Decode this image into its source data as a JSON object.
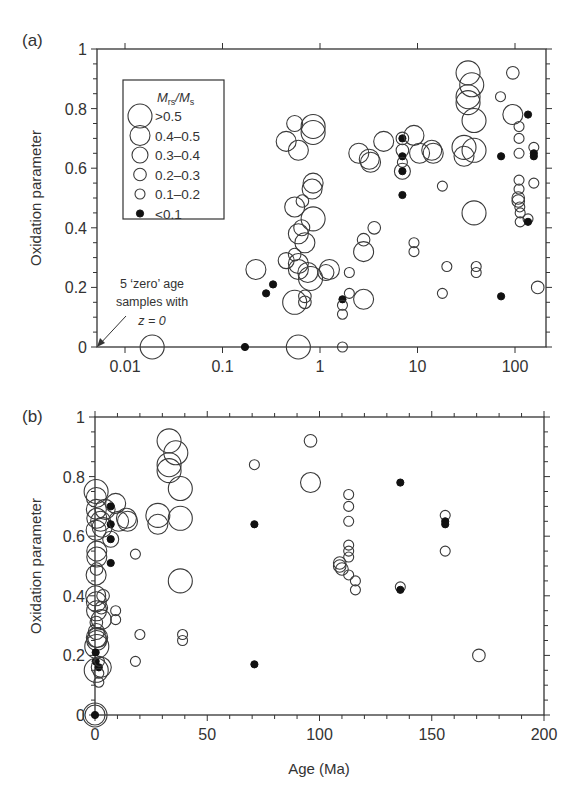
{
  "chart_data": [
    {
      "panel": "(a)",
      "type": "scatter",
      "xlabel": "",
      "ylabel": "Oxidation parameter",
      "xscale": "log",
      "xlim": [
        0.005,
        200
      ],
      "ylim": [
        0,
        1
      ],
      "xticks": [
        0.01,
        0.1,
        1,
        10,
        100
      ],
      "xtick_labels": [
        "0.01",
        "0.1",
        "1",
        "10",
        "100"
      ],
      "yticks": [
        0,
        0.2,
        0.4,
        0.6,
        0.8,
        1
      ],
      "ytick_labels": [
        "0",
        "0.2",
        "0.4",
        "0.6",
        "0.8",
        "1"
      ],
      "legend": {
        "title_main": "M",
        "title_sub1": "rs",
        "title_sep": "/M",
        "title_sub2": "s",
        "entries": [
          {
            "key": "s5",
            "label": ">0.5"
          },
          {
            "key": "s4",
            "label": "0.4–0.5"
          },
          {
            "key": "s3",
            "label": "0.3–0.4"
          },
          {
            "key": "s2",
            "label": "0.2–0.3"
          },
          {
            "key": "s1",
            "label": "0.1–0.2"
          },
          {
            "key": "f",
            "label": "<0.1"
          }
        ]
      },
      "annotation": {
        "line1": "5 ‘zero’ age",
        "line2": "samples with",
        "line3": "z = 0"
      },
      "points": [
        {
          "x": 0.019,
          "y": 0.0,
          "c": "s5"
        },
        {
          "x": 0.17,
          "y": 0.0,
          "c": "f"
        },
        {
          "x": 0.22,
          "y": 0.26,
          "c": "s4"
        },
        {
          "x": 0.28,
          "y": 0.18,
          "c": "f"
        },
        {
          "x": 0.33,
          "y": 0.21,
          "c": "f"
        },
        {
          "x": 0.45,
          "y": 0.69,
          "c": "s4"
        },
        {
          "x": 0.55,
          "y": 0.75,
          "c": "s3"
        },
        {
          "x": 0.6,
          "y": 0.66,
          "c": "s4"
        },
        {
          "x": 0.55,
          "y": 0.47,
          "c": "s4"
        },
        {
          "x": 0.66,
          "y": 0.49,
          "c": "s2"
        },
        {
          "x": 0.85,
          "y": 0.72,
          "c": "s5"
        },
        {
          "x": 0.85,
          "y": 0.74,
          "c": "s5"
        },
        {
          "x": 0.85,
          "y": 0.55,
          "c": "s4"
        },
        {
          "x": 0.83,
          "y": 0.53,
          "c": "s4"
        },
        {
          "x": 0.45,
          "y": 0.29,
          "c": "s3"
        },
        {
          "x": 0.55,
          "y": 0.31,
          "c": "s2"
        },
        {
          "x": 0.7,
          "y": 0.35,
          "c": "s4"
        },
        {
          "x": 0.6,
          "y": 0.38,
          "c": "s4"
        },
        {
          "x": 0.65,
          "y": 0.4,
          "c": "s3"
        },
        {
          "x": 0.85,
          "y": 0.43,
          "c": "s5"
        },
        {
          "x": 0.6,
          "y": 0.26,
          "c": "s4"
        },
        {
          "x": 0.6,
          "y": 0.28,
          "c": "s4"
        },
        {
          "x": 0.75,
          "y": 0.25,
          "c": "s4"
        },
        {
          "x": 0.8,
          "y": 0.23,
          "c": "s5"
        },
        {
          "x": 1.25,
          "y": 0.26,
          "c": "s4"
        },
        {
          "x": 1.15,
          "y": 0.25,
          "c": "s3"
        },
        {
          "x": 0.7,
          "y": 0.17,
          "c": "s2"
        },
        {
          "x": 0.7,
          "y": 0.15,
          "c": "s2"
        },
        {
          "x": 0.55,
          "y": 0.15,
          "c": "s5"
        },
        {
          "x": 0.6,
          "y": 0.0,
          "c": "s5"
        },
        {
          "x": 1.7,
          "y": 0.16,
          "c": "f"
        },
        {
          "x": 1.7,
          "y": 0.14,
          "c": "s1"
        },
        {
          "x": 1.7,
          "y": 0.11,
          "c": "s1"
        },
        {
          "x": 1.7,
          "y": 0.0,
          "c": "s1"
        },
        {
          "x": 2.0,
          "y": 0.25,
          "c": "s1"
        },
        {
          "x": 2.0,
          "y": 0.18,
          "c": "s1"
        },
        {
          "x": 2.8,
          "y": 0.16,
          "c": "s4"
        },
        {
          "x": 2.8,
          "y": 0.32,
          "c": "s4"
        },
        {
          "x": 2.8,
          "y": 0.36,
          "c": "s2"
        },
        {
          "x": 3.6,
          "y": 0.4,
          "c": "s2"
        },
        {
          "x": 2.5,
          "y": 0.65,
          "c": "s4"
        },
        {
          "x": 3.2,
          "y": 0.63,
          "c": "s4"
        },
        {
          "x": 3.3,
          "y": 0.62,
          "c": "s4"
        },
        {
          "x": 4.5,
          "y": 0.69,
          "c": "s4"
        },
        {
          "x": 7.0,
          "y": 0.7,
          "c": "f"
        },
        {
          "x": 7.0,
          "y": 0.7,
          "c": "s2"
        },
        {
          "x": 7.0,
          "y": 0.66,
          "c": "s2"
        },
        {
          "x": 7.0,
          "y": 0.64,
          "c": "f"
        },
        {
          "x": 7.0,
          "y": 0.62,
          "c": "s1"
        },
        {
          "x": 7.0,
          "y": 0.59,
          "c": "f"
        },
        {
          "x": 7.0,
          "y": 0.59,
          "c": "s3"
        },
        {
          "x": 7.0,
          "y": 0.51,
          "c": "f"
        },
        {
          "x": 9.2,
          "y": 0.71,
          "c": "s4"
        },
        {
          "x": 10.5,
          "y": 0.65,
          "c": "s4"
        },
        {
          "x": 14,
          "y": 0.66,
          "c": "s4"
        },
        {
          "x": 14.5,
          "y": 0.65,
          "c": "s4"
        },
        {
          "x": 18,
          "y": 0.54,
          "c": "s1"
        },
        {
          "x": 9.2,
          "y": 0.35,
          "c": "s1"
        },
        {
          "x": 9.2,
          "y": 0.32,
          "c": "s1"
        },
        {
          "x": 20,
          "y": 0.27,
          "c": "s1"
        },
        {
          "x": 18,
          "y": 0.18,
          "c": "s1"
        },
        {
          "x": 33,
          "y": 0.92,
          "c": "s5"
        },
        {
          "x": 36,
          "y": 0.88,
          "c": "s5"
        },
        {
          "x": 33,
          "y": 0.84,
          "c": "s5"
        },
        {
          "x": 33,
          "y": 0.82,
          "c": "s5"
        },
        {
          "x": 38,
          "y": 0.76,
          "c": "s5"
        },
        {
          "x": 30,
          "y": 0.67,
          "c": "s5"
        },
        {
          "x": 30,
          "y": 0.64,
          "c": "s4"
        },
        {
          "x": 38,
          "y": 0.66,
          "c": "s5"
        },
        {
          "x": 38,
          "y": 0.45,
          "c": "s5"
        },
        {
          "x": 40,
          "y": 0.27,
          "c": "s1"
        },
        {
          "x": 40,
          "y": 0.25,
          "c": "s1"
        },
        {
          "x": 72,
          "y": 0.17,
          "c": "f"
        },
        {
          "x": 72,
          "y": 0.64,
          "c": "f"
        },
        {
          "x": 71,
          "y": 0.84,
          "c": "s1"
        },
        {
          "x": 95,
          "y": 0.92,
          "c": "s2"
        },
        {
          "x": 95,
          "y": 0.78,
          "c": "s4"
        },
        {
          "x": 110,
          "y": 0.74,
          "c": "s1"
        },
        {
          "x": 110,
          "y": 0.7,
          "c": "s1"
        },
        {
          "x": 110,
          "y": 0.65,
          "c": "s1"
        },
        {
          "x": 110,
          "y": 0.56,
          "c": "s1"
        },
        {
          "x": 110,
          "y": 0.53,
          "c": "s1"
        },
        {
          "x": 108,
          "y": 0.5,
          "c": "s2"
        },
        {
          "x": 108,
          "y": 0.49,
          "c": "s2"
        },
        {
          "x": 112,
          "y": 0.47,
          "c": "s1"
        },
        {
          "x": 113,
          "y": 0.45,
          "c": "s1"
        },
        {
          "x": 113,
          "y": 0.42,
          "c": "s1"
        },
        {
          "x": 136,
          "y": 0.78,
          "c": "f"
        },
        {
          "x": 136,
          "y": 0.43,
          "c": "s1"
        },
        {
          "x": 136,
          "y": 0.42,
          "c": "f"
        },
        {
          "x": 156,
          "y": 0.67,
          "c": "s1"
        },
        {
          "x": 156,
          "y": 0.65,
          "c": "f"
        },
        {
          "x": 156,
          "y": 0.64,
          "c": "f"
        },
        {
          "x": 156,
          "y": 0.55,
          "c": "s1"
        },
        {
          "x": 171,
          "y": 0.2,
          "c": "s2"
        }
      ]
    },
    {
      "panel": "(b)",
      "type": "scatter",
      "xlabel": "Age (Ma)",
      "ylabel": "Oxidation parameter",
      "xscale": "linear",
      "xlim": [
        0,
        200
      ],
      "ylim": [
        0,
        1
      ],
      "xticks": [
        0,
        50,
        100,
        150,
        200
      ],
      "xtick_labels": [
        "0",
        "50",
        "100",
        "150",
        "200"
      ],
      "yticks": [
        0,
        0.2,
        0.4,
        0.6,
        0.8,
        1
      ],
      "ytick_labels": [
        "0",
        "0.2",
        "0.4",
        "0.6",
        "0.8",
        "1"
      ],
      "points": [
        {
          "x": 0,
          "y": 0.0,
          "c": "s5"
        },
        {
          "x": 0,
          "y": 0.0,
          "c": "s4"
        },
        {
          "x": 0,
          "y": 0.0,
          "c": "f"
        },
        {
          "x": 0.5,
          "y": 0.75,
          "c": "s5"
        },
        {
          "x": 0.6,
          "y": 0.73,
          "c": "s4"
        },
        {
          "x": 0.6,
          "y": 0.69,
          "c": "s4"
        },
        {
          "x": 0.8,
          "y": 0.66,
          "c": "s4"
        },
        {
          "x": 0.5,
          "y": 0.62,
          "c": "s4"
        },
        {
          "x": 0.8,
          "y": 0.55,
          "c": "s4"
        },
        {
          "x": 0.8,
          "y": 0.53,
          "c": "s4"
        },
        {
          "x": 0.5,
          "y": 0.47,
          "c": "s4"
        },
        {
          "x": 0.7,
          "y": 0.49,
          "c": "s2"
        },
        {
          "x": 0.3,
          "y": 0.4,
          "c": "s4"
        },
        {
          "x": 0.6,
          "y": 0.38,
          "c": "s4"
        },
        {
          "x": 0.7,
          "y": 0.35,
          "c": "s4"
        },
        {
          "x": 0.6,
          "y": 0.31,
          "c": "s2"
        },
        {
          "x": 0.6,
          "y": 0.28,
          "c": "s3"
        },
        {
          "x": 0.6,
          "y": 0.26,
          "c": "s4"
        },
        {
          "x": 0.75,
          "y": 0.25,
          "c": "s4"
        },
        {
          "x": 0.8,
          "y": 0.23,
          "c": "s5"
        },
        {
          "x": 1.2,
          "y": 0.26,
          "c": "s4"
        },
        {
          "x": 0.3,
          "y": 0.21,
          "c": "f"
        },
        {
          "x": 0.3,
          "y": 0.18,
          "c": "f"
        },
        {
          "x": 0.55,
          "y": 0.15,
          "c": "s5"
        },
        {
          "x": 1.7,
          "y": 0.16,
          "c": "f"
        },
        {
          "x": 1.7,
          "y": 0.14,
          "c": "s1"
        },
        {
          "x": 1.7,
          "y": 0.11,
          "c": "s1"
        },
        {
          "x": 2.0,
          "y": 0.18,
          "c": "s1"
        },
        {
          "x": 2.8,
          "y": 0.16,
          "c": "s4"
        },
        {
          "x": 2.8,
          "y": 0.32,
          "c": "s4"
        },
        {
          "x": 2.8,
          "y": 0.36,
          "c": "s2"
        },
        {
          "x": 3.6,
          "y": 0.4,
          "c": "s2"
        },
        {
          "x": 2.5,
          "y": 0.65,
          "c": "s4"
        },
        {
          "x": 3.2,
          "y": 0.63,
          "c": "s4"
        },
        {
          "x": 4.5,
          "y": 0.69,
          "c": "s4"
        },
        {
          "x": 7,
          "y": 0.7,
          "c": "f"
        },
        {
          "x": 7,
          "y": 0.64,
          "c": "f"
        },
        {
          "x": 7,
          "y": 0.59,
          "c": "f"
        },
        {
          "x": 7,
          "y": 0.59,
          "c": "s3"
        },
        {
          "x": 7,
          "y": 0.51,
          "c": "f"
        },
        {
          "x": 9.2,
          "y": 0.71,
          "c": "s4"
        },
        {
          "x": 10.5,
          "y": 0.65,
          "c": "s4"
        },
        {
          "x": 14,
          "y": 0.66,
          "c": "s4"
        },
        {
          "x": 14.5,
          "y": 0.65,
          "c": "s4"
        },
        {
          "x": 9.2,
          "y": 0.35,
          "c": "s1"
        },
        {
          "x": 9.2,
          "y": 0.32,
          "c": "s1"
        },
        {
          "x": 18,
          "y": 0.54,
          "c": "s1"
        },
        {
          "x": 20,
          "y": 0.27,
          "c": "s1"
        },
        {
          "x": 18,
          "y": 0.18,
          "c": "s1"
        },
        {
          "x": 33,
          "y": 0.92,
          "c": "s5"
        },
        {
          "x": 36,
          "y": 0.88,
          "c": "s5"
        },
        {
          "x": 33,
          "y": 0.84,
          "c": "s5"
        },
        {
          "x": 33,
          "y": 0.82,
          "c": "s5"
        },
        {
          "x": 38,
          "y": 0.76,
          "c": "s5"
        },
        {
          "x": 28,
          "y": 0.67,
          "c": "s5"
        },
        {
          "x": 28,
          "y": 0.64,
          "c": "s4"
        },
        {
          "x": 38,
          "y": 0.66,
          "c": "s5"
        },
        {
          "x": 38,
          "y": 0.45,
          "c": "s5"
        },
        {
          "x": 39,
          "y": 0.27,
          "c": "s1"
        },
        {
          "x": 39,
          "y": 0.25,
          "c": "s1"
        },
        {
          "x": 71,
          "y": 0.84,
          "c": "s1"
        },
        {
          "x": 71,
          "y": 0.64,
          "c": "f"
        },
        {
          "x": 71,
          "y": 0.17,
          "c": "f"
        },
        {
          "x": 96,
          "y": 0.92,
          "c": "s2"
        },
        {
          "x": 96,
          "y": 0.78,
          "c": "s4"
        },
        {
          "x": 113,
          "y": 0.74,
          "c": "s1"
        },
        {
          "x": 113,
          "y": 0.7,
          "c": "s1"
        },
        {
          "x": 113,
          "y": 0.65,
          "c": "s1"
        },
        {
          "x": 113,
          "y": 0.57,
          "c": "s1"
        },
        {
          "x": 113,
          "y": 0.55,
          "c": "s1"
        },
        {
          "x": 113,
          "y": 0.53,
          "c": "s1"
        },
        {
          "x": 109,
          "y": 0.51,
          "c": "s2"
        },
        {
          "x": 109,
          "y": 0.5,
          "c": "s2"
        },
        {
          "x": 110,
          "y": 0.49,
          "c": "s2"
        },
        {
          "x": 113,
          "y": 0.47,
          "c": "s1"
        },
        {
          "x": 116,
          "y": 0.45,
          "c": "s1"
        },
        {
          "x": 116,
          "y": 0.42,
          "c": "s1"
        },
        {
          "x": 136,
          "y": 0.78,
          "c": "f"
        },
        {
          "x": 136,
          "y": 0.43,
          "c": "s1"
        },
        {
          "x": 136,
          "y": 0.42,
          "c": "f"
        },
        {
          "x": 156,
          "y": 0.67,
          "c": "s1"
        },
        {
          "x": 156,
          "y": 0.65,
          "c": "f"
        },
        {
          "x": 156,
          "y": 0.64,
          "c": "f"
        },
        {
          "x": 156,
          "y": 0.55,
          "c": "s1"
        },
        {
          "x": 171,
          "y": 0.2,
          "c": "s2"
        }
      ]
    }
  ]
}
